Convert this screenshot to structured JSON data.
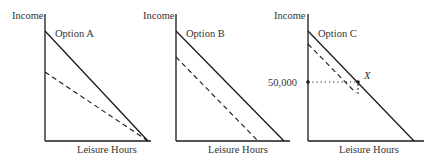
{
  "panels": [
    {
      "id": "A",
      "ylabel": "Income",
      "xlabel": "Leisure Hours",
      "option_label": "Option A"
    },
    {
      "id": "B",
      "ylabel": "Income",
      "xlabel": "Leisure Hours",
      "option_label": "Option B"
    },
    {
      "id": "C",
      "ylabel": "Income",
      "xlabel": "Leisure Hours",
      "option_label": "Option C",
      "tick_label": "50,000",
      "point_label": "X"
    }
  ],
  "colors": {
    "line": "#1a1a1a",
    "text": "#333333",
    "background": "#ffffff"
  }
}
